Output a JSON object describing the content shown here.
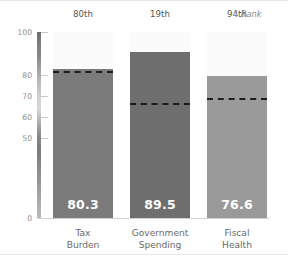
{
  "chart_data": {
    "type": "bar",
    "title": "",
    "subtitle": "",
    "xlabel": "",
    "ylabel": "",
    "ylim": [
      0,
      100
    ],
    "grid": false,
    "legend": null,
    "categories": [
      "Tax Burden",
      "Government Spending",
      "Fiscal Health"
    ],
    "category_lines": [
      [
        "Tax",
        "Burden"
      ],
      [
        "Government",
        "Spending"
      ],
      [
        "Fiscal",
        "Health"
      ]
    ],
    "values": [
      80.3,
      89.5,
      76.6
    ],
    "value_labels": [
      "80.3",
      "89.5",
      "76.6"
    ],
    "ranks": [
      "80th",
      "19th",
      "94th"
    ],
    "reference_values": [
      79.0,
      62.0,
      64.5
    ],
    "bar_colors": [
      "#7b7b7b",
      "#6e6e6e",
      "#9a9a9a"
    ],
    "reference_line_color": "#1d1d1d",
    "reference_line_style": "dashed",
    "ytick_values": [
      100,
      80,
      70,
      60,
      50,
      0
    ],
    "ytick_labels": [
      "100",
      "80",
      "70",
      "60",
      "50",
      "0"
    ],
    "axis_spine_gradient": true,
    "annotations": [
      {
        "text": "Rank",
        "position": "top-right",
        "marker": "‹"
      }
    ]
  },
  "header": {
    "rank_annotation_label": "Rank",
    "rank_annotation_caret": "‹"
  },
  "colors": {
    "background": "#ffffff",
    "bar_1": "#7b7b7b",
    "bar_2": "#6e6e6e",
    "bar_3": "#9a9a9a",
    "value_text": "#ffffff",
    "tick_text": "#8d8d8d",
    "category_text": "#6a6a6a",
    "rank_text": "#555555",
    "reference_line": "#1d1d1d",
    "column_band": "#fbfbfb"
  }
}
